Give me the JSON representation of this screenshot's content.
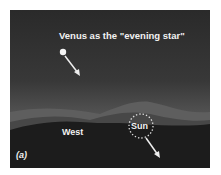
{
  "figure": {
    "title": "Venus as the \"evening star\"",
    "direction_label": "West",
    "sun_label": "Sun",
    "panel_label": "(a)",
    "colors": {
      "sky_top": "#2a2a2a",
      "sky_horizon": "#666666",
      "hills_far": "#5e5e5e",
      "hills_mid": "#474747",
      "ground": "#1c1c1c",
      "text": "#f2f2f2"
    }
  }
}
